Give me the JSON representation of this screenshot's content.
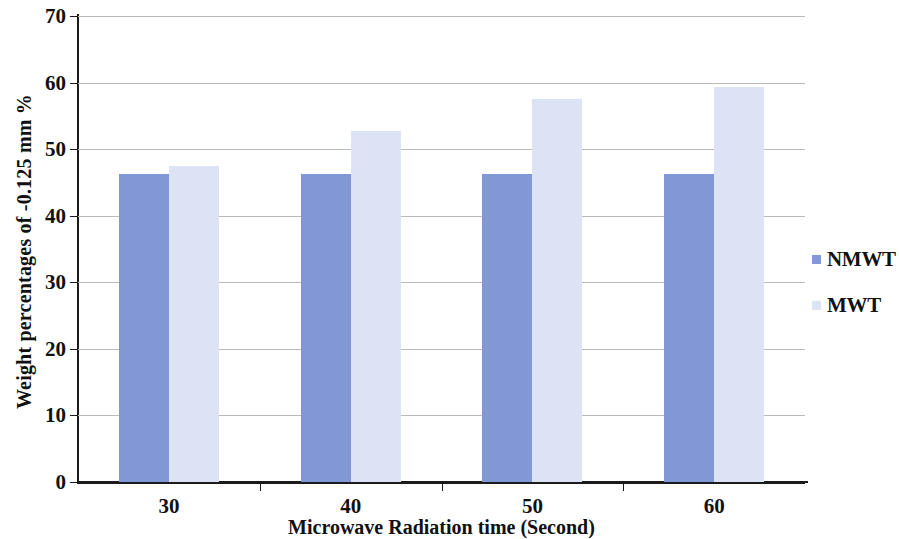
{
  "chart_data": {
    "type": "bar",
    "title": "",
    "categories": [
      "30",
      "40",
      "50",
      "60"
    ],
    "series": [
      {
        "name": "NMWT",
        "color": "#8298d6",
        "values": [
          46.2,
          46.2,
          46.2,
          46.2
        ]
      },
      {
        "name": "MWT",
        "color": "#dbe3f4",
        "values": [
          47.4,
          52.7,
          57.5,
          59.4
        ]
      }
    ],
    "xlabel": "Microwave Radiation time (Second)",
    "ylabel": "Weight percentages of -0.125 mm %",
    "ylim": [
      0,
      70
    ],
    "yticks": [
      0,
      10,
      20,
      30,
      40,
      50,
      60,
      70
    ],
    "ytick_labels": [
      "0",
      "10",
      "20",
      "30",
      "40",
      "50",
      "60",
      "70"
    ],
    "grid": true,
    "legend_position": "right"
  },
  "axes": {
    "y_title": "Weight percentages of -0.125 mm %",
    "x_title": "Microwave Radiation time (Second)"
  },
  "legend": {
    "items": [
      {
        "label": "NMWT",
        "color": "#8298d6"
      },
      {
        "label": "MWT",
        "color": "#dbe3f4"
      }
    ]
  },
  "colors": {
    "nmwt": "#8298d6",
    "mwt": "#dbe3f4",
    "axis": "#1b1b1b",
    "grid": "#b9b9b9",
    "background": "#ffffff"
  }
}
